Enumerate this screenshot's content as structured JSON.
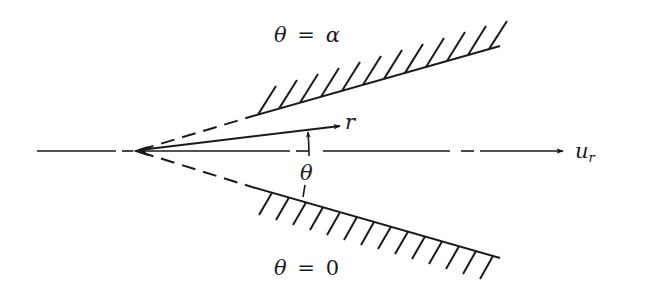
{
  "diagram": {
    "colors": {
      "stroke": "#1a1a1a",
      "background": "#ffffff"
    },
    "labels": {
      "upper_wall": {
        "theta": "θ",
        "eq": "=",
        "value": "α"
      },
      "lower_wall": {
        "theta": "θ",
        "eq": "=",
        "value": "0"
      },
      "radial_coordinate": "r",
      "angle": "θ",
      "velocity": {
        "main": "u",
        "subscript": "r"
      }
    },
    "elements": {
      "apex": {
        "x": 137,
        "y": 151
      },
      "axis": {
        "style": "dash-dot",
        "from": [
          37,
          151
        ],
        "to": [
          563,
          151
        ],
        "arrow": "end"
      },
      "upper_wall": {
        "dashed_from": [
          137,
          151
        ],
        "solid_from": [
          253,
          116
        ],
        "to": [
          500,
          46
        ],
        "hatching": "outside"
      },
      "lower_wall": {
        "dashed_from": [
          137,
          151
        ],
        "solid_from": [
          252,
          187
        ],
        "to": [
          500,
          258
        ],
        "hatching": "outside"
      },
      "radial_ray": {
        "from": [
          137,
          151
        ],
        "to": [
          340,
          126
        ],
        "arrow": "end"
      },
      "angle_arrow": {
        "x": 308,
        "from_y": 168,
        "to_y": 130
      }
    }
  }
}
